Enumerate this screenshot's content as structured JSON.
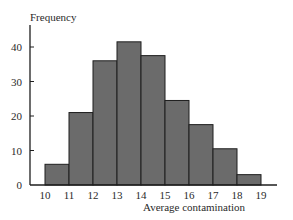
{
  "chart_data": {
    "type": "bar",
    "title": "",
    "xlabel": "Average contamination",
    "ylabel": "Frequency",
    "categories": [
      "10-11",
      "11-12",
      "12-13",
      "13-14",
      "14-15",
      "15-16",
      "16-17",
      "17-18",
      "18-19"
    ],
    "bin_edges": [
      10,
      11,
      12,
      13,
      14,
      15,
      16,
      17,
      18,
      19
    ],
    "values": [
      6,
      21,
      36,
      41.5,
      37.5,
      24.5,
      17.5,
      10.5,
      3
    ],
    "xticks": [
      "10",
      "11",
      "12",
      "13",
      "14",
      "15",
      "16",
      "17",
      "18",
      "19"
    ],
    "yticks": [
      "0",
      "10",
      "20",
      "30",
      "40"
    ],
    "ylim": [
      0,
      46
    ],
    "xlim": [
      9.4,
      19.6
    ],
    "grid": false,
    "legend": null,
    "histogram": true
  },
  "style": {
    "bar_fill": "#6b6b6b",
    "bar_stroke": "#1e1e1e",
    "axis_color": "#1e1e1e"
  }
}
